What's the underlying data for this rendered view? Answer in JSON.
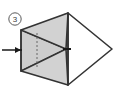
{
  "diagram": {
    "step_number": "3",
    "step_badge": {
      "label": "3",
      "shape": "circle",
      "center_x": 15,
      "center_y": 19,
      "radius": 6.2,
      "stroke": "#555555",
      "fill": "#ffffff"
    },
    "background_color": "#ffffff",
    "colors": {
      "shaded_face": "#d2d2d2",
      "shaded_face_alt": "#c9c9c9",
      "unshaded_face": "#ffffff",
      "outline": "#333333",
      "thin_line": "#555555",
      "dashed_line": "#666666",
      "arrow": "#1a1a1a"
    },
    "shapes": [
      {
        "name": "upper-shaded-face",
        "kind": "polygon",
        "points": "21,30 68,13 66,49",
        "fill": "#d2d2d2",
        "stroke": "#333333",
        "stroke_width": 1.6
      },
      {
        "name": "lower-shaded-face",
        "kind": "polygon",
        "points": "21,71 68,85 66,49",
        "fill": "#d2d2d2",
        "stroke": "#333333",
        "stroke_width": 1.6
      },
      {
        "name": "left-shaded-band",
        "kind": "polygon",
        "points": "21,30 66,49 21,71",
        "fill": "#cdcdcd",
        "stroke": "#333333",
        "stroke_width": 1.2
      },
      {
        "name": "right-white-triangle",
        "kind": "polygon",
        "points": "68,13 112,49 68,85",
        "fill": "#ffffff",
        "stroke": "#333333",
        "stroke_width": 1.6
      },
      {
        "name": "vertical-fold-edge",
        "kind": "line",
        "x1": 21,
        "y1": 30,
        "x2": 21,
        "y2": 71,
        "stroke": "#333333",
        "stroke_width": 1.6
      },
      {
        "name": "right-spine-edge",
        "kind": "line",
        "x1": 68,
        "y1": 13,
        "x2": 68,
        "y2": 85,
        "stroke": "#333333",
        "stroke_width": 1.6
      },
      {
        "name": "apex-notch-line",
        "kind": "line",
        "x1": 66,
        "y1": 49,
        "x2": 70,
        "y2": 49,
        "stroke": "#1a1a1a",
        "stroke_width": 2.0
      }
    ],
    "dashed_line": {
      "name": "hidden-crease",
      "x1": 37,
      "y1": 33,
      "x2": 37,
      "y2": 67,
      "stroke": "#666666",
      "stroke_width": 1,
      "dash_pattern": "2,2"
    },
    "arrow": {
      "name": "fold-direction-arrow",
      "direction": "right",
      "x1": 2,
      "y1": 50,
      "x2": 21,
      "y2": 50,
      "head_points": "21,50 15,47 15,53",
      "stroke": "#1a1a1a",
      "stroke_width": 1.4
    }
  }
}
